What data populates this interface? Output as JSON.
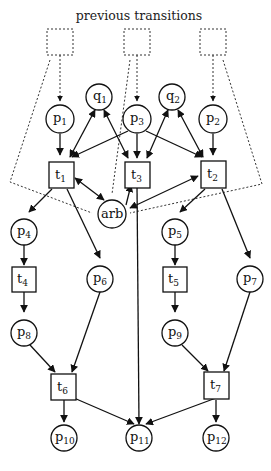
{
  "title": "previous transitions",
  "previous_transitions": [
    {
      "id": "prev1"
    },
    {
      "id": "prev2"
    },
    {
      "id": "prev3"
    }
  ],
  "places": {
    "p1": {
      "base": "p",
      "sub": "1"
    },
    "p2": {
      "base": "p",
      "sub": "2"
    },
    "p3": {
      "base": "p",
      "sub": "3"
    },
    "q1": {
      "base": "q",
      "sub": "1"
    },
    "q2": {
      "base": "q",
      "sub": "2"
    },
    "arb": {
      "base": "arb",
      "sub": ""
    },
    "p4": {
      "base": "p",
      "sub": "4"
    },
    "p5": {
      "base": "p",
      "sub": "5"
    },
    "p6": {
      "base": "p",
      "sub": "6"
    },
    "p7": {
      "base": "p",
      "sub": "7"
    },
    "p8": {
      "base": "p",
      "sub": "8"
    },
    "p9": {
      "base": "p",
      "sub": "9"
    },
    "p10": {
      "base": "p",
      "sub": "10"
    },
    "p11": {
      "base": "p",
      "sub": "11"
    },
    "p12": {
      "base": "p",
      "sub": "12"
    }
  },
  "transitions": {
    "t1": {
      "base": "t",
      "sub": "1"
    },
    "t2": {
      "base": "t",
      "sub": "2"
    },
    "t3": {
      "base": "t",
      "sub": "3"
    },
    "t4": {
      "base": "t",
      "sub": "4"
    },
    "t5": {
      "base": "t",
      "sub": "5"
    },
    "t6": {
      "base": "t",
      "sub": "6"
    },
    "t7": {
      "base": "t",
      "sub": "7"
    }
  },
  "arcs": [
    "prev1->p1",
    "prev2->p3",
    "prev3->p2",
    "p1->t1",
    "p3->t1",
    "p3->t3",
    "p3->t2",
    "p2->t2",
    "q1<->t1",
    "q1<->t3",
    "q2<->t3",
    "q2<->t2",
    "arb<->t1",
    "arb->t3",
    "arb<->t2",
    "t1->p4",
    "t1->p6",
    "t2->p5",
    "t2->p7",
    "p4->t4",
    "t4->p8",
    "p5->t5",
    "t5->p9",
    "p8->t6",
    "p6->t6",
    "p9->t7",
    "p7->t7",
    "t6->p10",
    "t6->p11",
    "t3->p11",
    "t7->p11",
    "t7->p12"
  ]
}
